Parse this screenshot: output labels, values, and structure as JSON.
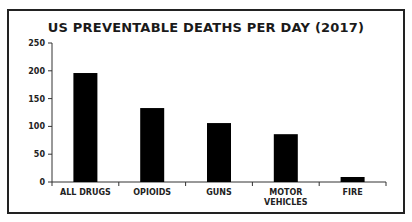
{
  "chart_data": {
    "type": "bar",
    "title": "US PREVENTABLE DEATHS PER DAY (2017)",
    "xlabel": "",
    "ylabel": "",
    "categories": [
      "ALL DRUGS",
      "OPIOIDS",
      "GUNS",
      "MOTOR VEHICLES",
      "FIRE"
    ],
    "category_lines": [
      [
        "ALL DRUGS"
      ],
      [
        "OPIOIDS"
      ],
      [
        "GUNS"
      ],
      [
        "MOTOR",
        "VEHICLES"
      ],
      [
        "FIRE"
      ]
    ],
    "values": [
      196,
      133,
      106,
      86,
      9
    ],
    "ylim": [
      0,
      250
    ],
    "yticks": [
      0,
      50,
      100,
      150,
      200,
      250
    ],
    "grid": false,
    "legend": null,
    "bar_color": "#000000"
  }
}
